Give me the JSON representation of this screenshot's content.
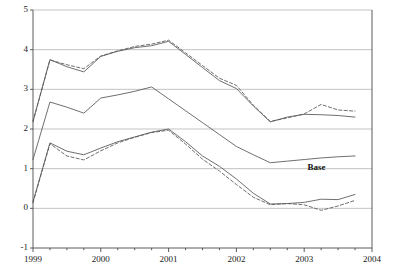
{
  "chart_data": {
    "type": "line",
    "title": "",
    "subtitle": "",
    "xlabel": "",
    "ylabel": "",
    "xlim": [
      1999.0,
      2004.0
    ],
    "ylim": [
      -1,
      5
    ],
    "grid": true,
    "grid_axis": "y",
    "legend_position": "inline-right",
    "xticks": [
      "1999",
      "2000",
      "2001",
      "2002",
      "2003",
      "2004"
    ],
    "xtick_values": [
      1999,
      2000,
      2001,
      2002,
      2003,
      2004
    ],
    "yticks": [
      "5",
      "4",
      "3",
      "2",
      "1",
      "0",
      "-1"
    ],
    "ytick_values": [
      5,
      4,
      3,
      2,
      1,
      0,
      -1
    ],
    "minor_xticks_per_year": 4,
    "x": [
      1999.0,
      1999.25,
      1999.5,
      1999.75,
      2000.0,
      2000.25,
      2000.5,
      2000.75,
      2001.0,
      2001.25,
      2001.5,
      2001.75,
      2002.0,
      2002.25,
      2002.5,
      2002.75,
      2003.0,
      2003.25,
      2003.5,
      2003.75
    ],
    "annotations": [
      {
        "text": "Base",
        "x": 2003.05,
        "y": 1.02,
        "series": "base"
      }
    ],
    "series": [
      {
        "name": "upper-solid",
        "style": "solid",
        "color": "#555555",
        "values": [
          2.2,
          3.75,
          3.57,
          3.44,
          3.83,
          3.96,
          4.05,
          4.1,
          4.21,
          3.88,
          3.55,
          3.22,
          3.02,
          2.58,
          2.18,
          2.3,
          2.37,
          2.36,
          2.34,
          2.3
        ]
      },
      {
        "name": "upper-dashed",
        "style": "dashed",
        "color": "#555555",
        "values": [
          2.18,
          3.74,
          3.62,
          3.52,
          3.84,
          3.97,
          4.08,
          4.14,
          4.24,
          3.92,
          3.6,
          3.28,
          3.1,
          2.6,
          2.19,
          2.28,
          2.38,
          2.62,
          2.48,
          2.45
        ]
      },
      {
        "name": "base",
        "style": "solid",
        "color": "#555555",
        "values": [
          1.23,
          2.68,
          2.55,
          2.4,
          2.78,
          2.86,
          2.95,
          3.06,
          2.76,
          2.46,
          2.16,
          1.86,
          1.56,
          1.35,
          1.15,
          1.19,
          1.23,
          1.27,
          1.3,
          1.32
        ]
      },
      {
        "name": "lower-solid",
        "style": "solid",
        "color": "#555555",
        "values": [
          0.17,
          1.65,
          1.44,
          1.35,
          1.52,
          1.68,
          1.8,
          1.92,
          2.0,
          1.68,
          1.32,
          1.06,
          0.74,
          0.38,
          0.11,
          0.12,
          0.15,
          0.23,
          0.22,
          0.35
        ]
      },
      {
        "name": "lower-dashed",
        "style": "dashed",
        "color": "#555555",
        "values": [
          0.14,
          1.63,
          1.32,
          1.22,
          1.45,
          1.65,
          1.79,
          1.91,
          1.97,
          1.62,
          1.24,
          0.94,
          0.6,
          0.28,
          0.09,
          0.12,
          0.09,
          -0.05,
          0.06,
          0.2
        ]
      }
    ]
  },
  "axis": {
    "y_label_texts": [
      "5",
      "4",
      "3",
      "2",
      "1",
      "0",
      "-1"
    ],
    "x_label_texts": [
      "1999",
      "2000",
      "2001",
      "2002",
      "2003",
      "2004"
    ]
  },
  "colors": {
    "line": "#555555",
    "grid": "#a9a9a9",
    "axis": "#4a4a4a",
    "text": "#111111"
  }
}
